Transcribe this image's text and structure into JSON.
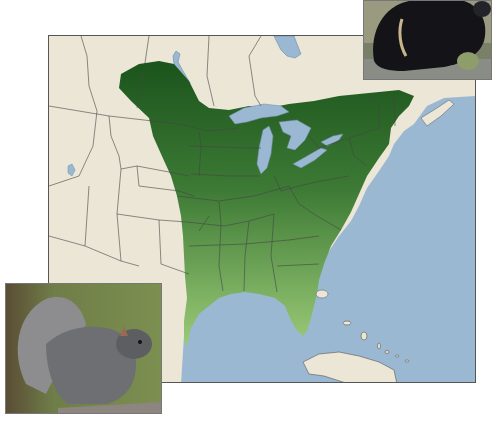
{
  "map": {
    "title": "Eastern Gray Squirrel Range",
    "region": "Eastern North America",
    "colors": {
      "land": "#ebe6d6",
      "water": "#9bb8d3",
      "range_dark": "#1f5a1f",
      "range_light": "#8fbf6a",
      "borders": "#444444",
      "frame": "#555555"
    },
    "legend": []
  },
  "insets": [
    {
      "id": "black-squirrel",
      "subject": "Black-morph squirrel eating nut",
      "position": "top-right"
    },
    {
      "id": "gray-squirrel",
      "subject": "Gray squirrel eating",
      "position": "bottom-left"
    }
  ]
}
